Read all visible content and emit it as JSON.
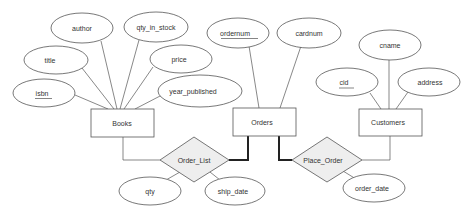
{
  "diagram": {
    "type": "ER diagram",
    "entities": [
      {
        "id": "books",
        "label": "Books"
      },
      {
        "id": "orders",
        "label": "Orders"
      },
      {
        "id": "customers",
        "label": "Customers"
      }
    ],
    "relationships": [
      {
        "id": "order_list",
        "label": "Order_List",
        "connects": [
          "Books",
          "Orders"
        ],
        "participation": {
          "Orders": "bold"
        }
      },
      {
        "id": "place_order",
        "label": "Place_Order",
        "connects": [
          "Orders",
          "Customers"
        ],
        "participation": {
          "Orders": "bold"
        }
      }
    ],
    "attributes": {
      "books": [
        {
          "label": "isbn",
          "key": true
        },
        {
          "label": "title",
          "key": false
        },
        {
          "label": "author",
          "key": false
        },
        {
          "label": "qty_in_stock",
          "key": false
        },
        {
          "label": "price",
          "key": false
        },
        {
          "label": "year_published",
          "key": false
        }
      ],
      "orders": [
        {
          "label": "ordernum",
          "key": true
        },
        {
          "label": "cardnum",
          "key": false
        }
      ],
      "customers": [
        {
          "label": "cid",
          "key": true
        },
        {
          "label": "cname",
          "key": false
        },
        {
          "label": "address",
          "key": false
        }
      ],
      "order_list": [
        {
          "label": "qty",
          "key": false
        },
        {
          "label": "ship_date",
          "key": false
        }
      ],
      "place_order": [
        {
          "label": "order_date",
          "key": false
        }
      ]
    }
  }
}
